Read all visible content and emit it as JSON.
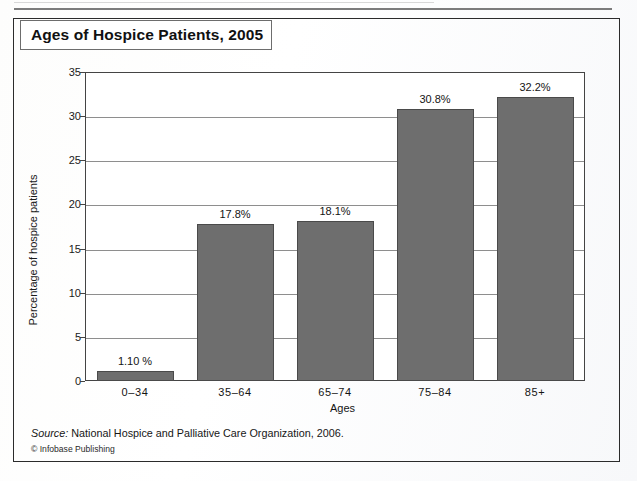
{
  "figure": {
    "title": "Ages of Hospice Patients, 2005",
    "source_keyword": "Source:",
    "source_text": " National Hospice and Palliative Care Organization, 2006.",
    "copyright": "© Infobase Publishing"
  },
  "chart_data": {
    "type": "bar",
    "title": "Ages of Hospice Patients, 2005",
    "categories": [
      "0–34",
      "35–64",
      "65–74",
      "75–84",
      "85+"
    ],
    "values": [
      1.1,
      17.8,
      18.1,
      30.8,
      32.2
    ],
    "data_labels": [
      "1.10 %",
      "17.8%",
      "18.1%",
      "30.8%",
      "32.2%"
    ],
    "xlabel": "Ages",
    "ylabel": "Percentage of hospice patients",
    "ylim": [
      0,
      35
    ],
    "ytick_labels": [
      "0",
      "5",
      "10",
      "15",
      "20",
      "25",
      "30",
      "35"
    ],
    "ytick_values": [
      0,
      5,
      10,
      15,
      20,
      25,
      30,
      35
    ],
    "grid": true,
    "legend": "none",
    "bar_color": "#6e6e6e",
    "bar_edge_color": "#4a4a4a",
    "plot_bg": "#ffffff",
    "gridline_color": "#8e8e8e"
  }
}
